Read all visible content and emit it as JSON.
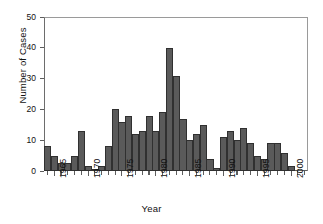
{
  "chart_data": {
    "type": "bar",
    "title": "",
    "xlabel": "Year",
    "ylabel": "Number of Cases",
    "ylim": [
      0,
      50
    ],
    "xlim": [
      1963.5,
      2002.5
    ],
    "yticks": [
      0,
      10,
      20,
      30,
      40,
      50
    ],
    "xticks": [
      1965,
      1970,
      1975,
      1980,
      1985,
      1990,
      1995,
      2000
    ],
    "grid": false,
    "legend": null,
    "bar_color": "#5a5a5a",
    "bar_edge_color": "#303030",
    "categories": [
      1964,
      1965,
      1966,
      1967,
      1968,
      1969,
      1970,
      1971,
      1972,
      1973,
      1974,
      1975,
      1976,
      1977,
      1978,
      1979,
      1980,
      1981,
      1982,
      1983,
      1984,
      1985,
      1986,
      1987,
      1988,
      1989,
      1990,
      1991,
      1992,
      1993,
      1994,
      1995,
      1996,
      1997,
      1998,
      1999,
      2000,
      2001,
      2002
    ],
    "values": [
      8,
      5,
      2.5,
      2.5,
      5,
      13,
      1.5,
      0.5,
      1.5,
      8,
      20,
      16,
      18,
      12,
      13,
      18,
      13,
      19,
      40,
      31,
      17,
      10,
      12,
      15,
      4,
      1,
      11,
      13,
      10,
      14,
      9,
      5,
      4,
      9,
      9,
      6,
      1.5,
      0,
      0
    ],
    "series_name": "Cases"
  },
  "axes": {
    "y_title": "Number of Cases",
    "x_title": "Year",
    "y_tick_labels": [
      "0",
      "10",
      "20",
      "30",
      "40",
      "50"
    ],
    "x_tick_labels": [
      "1965",
      "1970",
      "1975",
      "1980",
      "1985",
      "1990",
      "1995",
      "2000"
    ]
  }
}
